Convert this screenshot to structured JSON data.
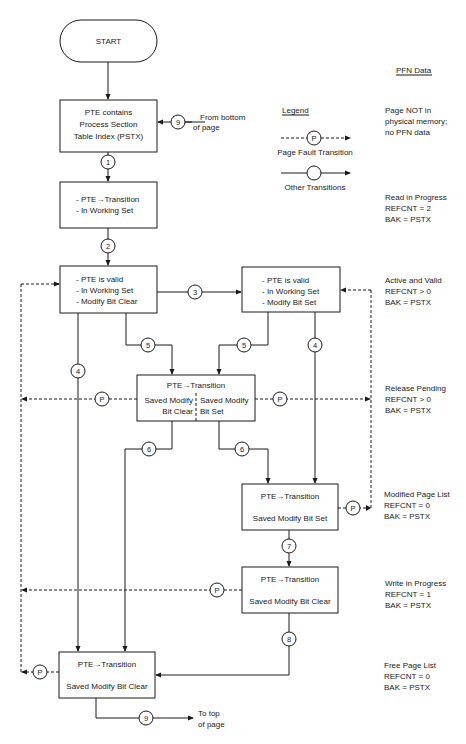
{
  "start": {
    "label": "START"
  },
  "pfn_header": "PFN Data",
  "legend": {
    "title": "Legend",
    "page_fault": {
      "symbol": "P",
      "label": "Page Fault Transition"
    },
    "other": {
      "label": "Other Transitions"
    }
  },
  "boxes": {
    "pstx": {
      "lines": [
        "PTE contains",
        "Process Section",
        "Table Index (PSTX)"
      ]
    },
    "read": {
      "lines": [
        "- PTE→Transition",
        "- In Working Set"
      ]
    },
    "valid_clear": {
      "lines": [
        "- PTE is valid",
        "- In Working Set",
        "- Modify Bit Clear"
      ]
    },
    "valid_set": {
      "lines": [
        "- PTE is valid",
        "- In Working Set",
        "- Modify Bit Set"
      ]
    },
    "release": {
      "title": "PTE→Transition",
      "left": [
        "Saved Modify",
        "Bit Clear"
      ],
      "right": [
        "Saved Modify",
        "Bit Set"
      ]
    },
    "modified": {
      "lines": [
        "PTE→Transition",
        "Saved Modify Bit Set"
      ]
    },
    "write": {
      "lines": [
        "PTE→Transition",
        "Saved Modify Bit Clear"
      ]
    },
    "free": {
      "lines": [
        "PTE→Transition",
        "Saved Modify Bit Clear"
      ]
    }
  },
  "connectors": {
    "c1": "1",
    "c2": "2",
    "c3": "3",
    "c4": "4",
    "c5": "5",
    "c6": "6",
    "c7": "7",
    "c8": "8",
    "c9": "9",
    "p": "P"
  },
  "notes": {
    "from_bottom": [
      "From bottom",
      "of page"
    ],
    "to_top": [
      "To top",
      "of page"
    ]
  },
  "pfn_states": [
    {
      "lines": [
        "Page NOT in",
        "physical memory;",
        "no PFN data"
      ]
    },
    {
      "lines": [
        "Read in Progress",
        "REFCNT = 2",
        "BAK = PSTX"
      ]
    },
    {
      "lines": [
        "Active and Valid",
        "REFCNT > 0",
        "BAK = PSTX"
      ]
    },
    {
      "lines": [
        "Release Pending",
        "REFCNT > 0",
        "BAK = PSTX"
      ]
    },
    {
      "lines": [
        "Modified Page List",
        "REFCNT = 0",
        "BAK = PSTX"
      ]
    },
    {
      "lines": [
        "Write in Progress",
        "REFCNT = 1",
        "BAK = PSTX"
      ]
    },
    {
      "lines": [
        "Free Page List",
        "REFCNT = 0",
        "BAK = PSTX"
      ]
    }
  ]
}
